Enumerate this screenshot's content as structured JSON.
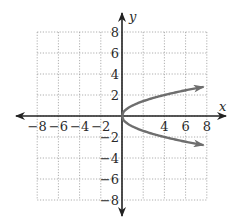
{
  "chart_data": {
    "type": "line",
    "title": "",
    "xlabel": "x",
    "ylabel": "y",
    "xlim": [
      -8,
      8
    ],
    "ylim": [
      -8,
      8
    ],
    "grid": true,
    "grid_step": 2,
    "x_ticks": [
      "-8",
      "-6",
      "-4",
      "-2",
      "4",
      "6",
      "8"
    ],
    "y_ticks": [
      "8",
      "6",
      "4",
      "2",
      "-2",
      "-4",
      "-6",
      "-8"
    ],
    "series": [
      {
        "name": "upper branch (y = sqrt(x))",
        "x": [
          0,
          0.5,
          1,
          2,
          3,
          4,
          5,
          6,
          7,
          8
        ],
        "y": [
          0,
          0.71,
          1,
          1.41,
          1.73,
          2,
          2.24,
          2.45,
          2.65,
          2.83
        ],
        "arrow_end": true
      },
      {
        "name": "lower branch (y = -sqrt(x))",
        "x": [
          0,
          0.5,
          1,
          2,
          3,
          4,
          5,
          6,
          7,
          8
        ],
        "y": [
          0,
          -0.71,
          -1,
          -1.41,
          -1.73,
          -2,
          -2.24,
          -2.45,
          -2.65,
          -2.83
        ],
        "arrow_end": true
      }
    ],
    "relation": "x = y^2",
    "colors": {
      "axes": "#222222",
      "curve": "#6e6e6e",
      "grid": "#9a9a9a"
    }
  }
}
